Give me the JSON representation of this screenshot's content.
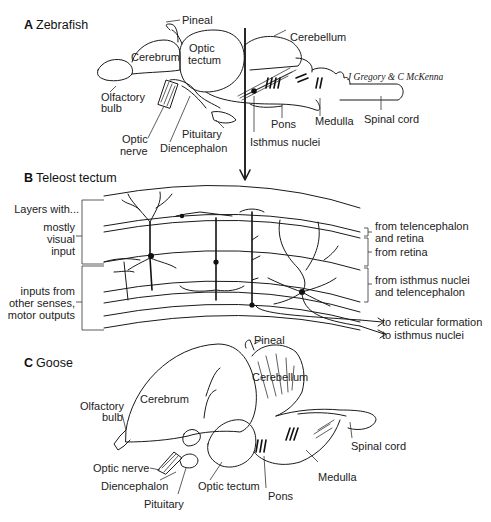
{
  "figure": {
    "panels": [
      {
        "id": "A",
        "letter": "A",
        "title": "Zebrafish",
        "labels": {
          "pineal": "Pineal",
          "cerebrum": "Cerebrum",
          "optic_tectum_1": "Optic",
          "optic_tectum_2": "tectum",
          "cerebellum": "Cerebellum",
          "olfactory_bulb_1": "Olfactory",
          "olfactory_bulb_2": "bulb",
          "optic_nerve_1": "Optic",
          "optic_nerve_2": "nerve",
          "pituitary": "Pituitary",
          "diencephalon": "Diencephalon",
          "pons": "Pons",
          "isthmus_nuclei": "Isthmus nuclei",
          "medulla": "Medulla",
          "spinal_cord": "Spinal cord"
        },
        "credit": "J Gregory & C McKenna"
      },
      {
        "id": "B",
        "letter": "B",
        "title": "Teleost tectum",
        "left_labels": {
          "header": "Layers with...",
          "visual_1": "mostly",
          "visual_2": "visual",
          "visual_3": "input",
          "other_1": "inputs from",
          "other_2": "other senses,",
          "other_3": "motor outputs"
        },
        "right_labels": {
          "telencephalon_retina_1": "from telencephalon",
          "telencephalon_retina_2": "and retina",
          "retina": "from retina",
          "isthmus_1": "from isthmus nuclei",
          "isthmus_2": "and telencephalon",
          "reticular": "to reticular formation",
          "isthmus_out": "to isthmus nuclei"
        }
      },
      {
        "id": "C",
        "letter": "C",
        "title": "Goose",
        "labels": {
          "pineal": "Pineal",
          "cerebellum": "Cerebellum",
          "cerebrum": "Cerebrum",
          "olfactory_bulb_1": "Olfactory",
          "olfactory_bulb_2": "bulb",
          "optic_nerve": "Optic nerve",
          "diencephalon": "Diencephalon",
          "pituitary": "Pituitary",
          "optic_tectum": "Optic tectum",
          "pons": "Pons",
          "medulla": "Medulla",
          "spinal_cord": "Spinal cord"
        }
      }
    ]
  }
}
